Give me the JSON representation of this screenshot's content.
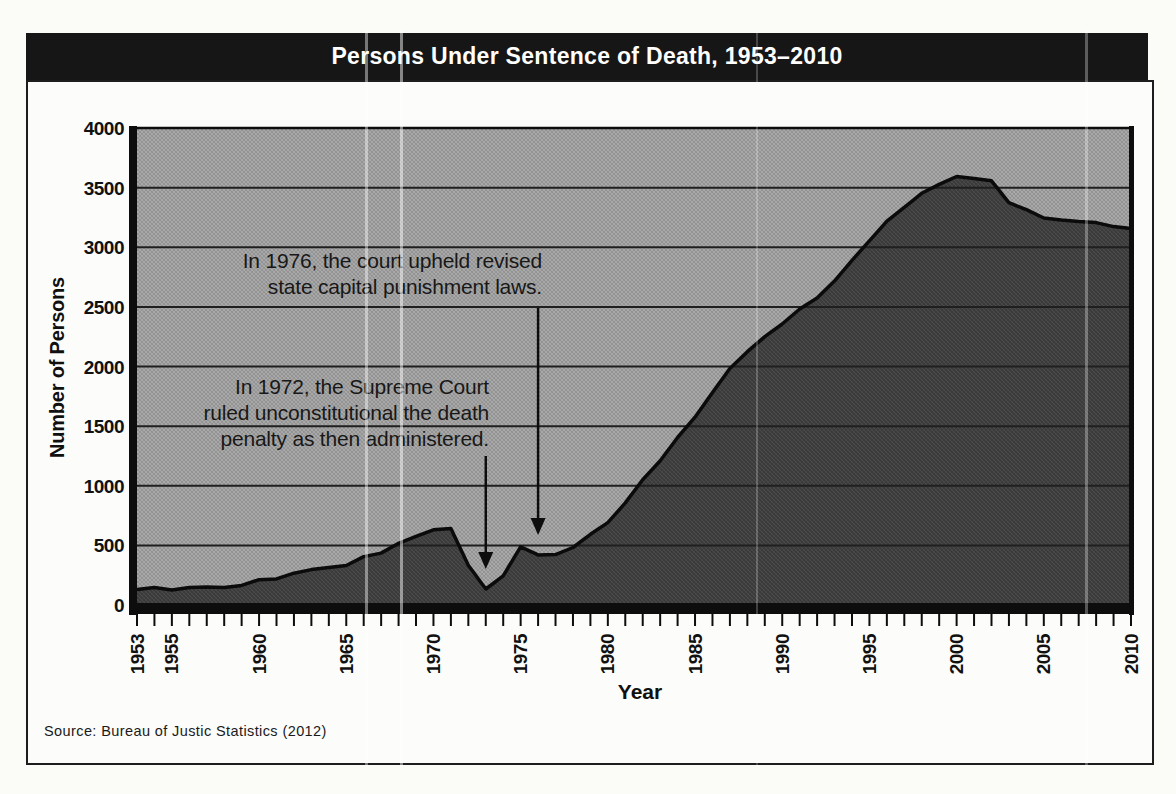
{
  "header": {
    "title": "Persons Under Sentence of Death, 1953–2010",
    "background": "#161616",
    "text_color": "#ffffff"
  },
  "chart_data": {
    "type": "area",
    "title": "Persons Under Sentence of Death, 1953–2010",
    "xlabel": "Year",
    "ylabel": "Number of Persons",
    "ylim": [
      0,
      4000
    ],
    "ytick_step": 500,
    "yticks": [
      0,
      500,
      1000,
      1500,
      2000,
      2500,
      3000,
      3500,
      4000
    ],
    "xtick_labels": [
      1953,
      1955,
      1960,
      1965,
      1970,
      1975,
      1980,
      1985,
      1990,
      1995,
      2000,
      2005,
      2010
    ],
    "grid": "horizontal",
    "legend": "none",
    "x": [
      1953,
      1954,
      1955,
      1956,
      1957,
      1958,
      1959,
      1960,
      1961,
      1962,
      1963,
      1964,
      1965,
      1966,
      1967,
      1968,
      1969,
      1970,
      1971,
      1972,
      1973,
      1974,
      1975,
      1976,
      1977,
      1978,
      1979,
      1980,
      1981,
      1982,
      1983,
      1984,
      1985,
      1986,
      1987,
      1988,
      1989,
      1990,
      1991,
      1992,
      1993,
      1994,
      1995,
      1996,
      1997,
      1998,
      1999,
      2000,
      2001,
      2002,
      2003,
      2004,
      2005,
      2006,
      2007,
      2008,
      2009,
      2010
    ],
    "values": [
      131,
      147,
      125,
      146,
      151,
      147,
      164,
      212,
      219,
      267,
      297,
      315,
      331,
      406,
      435,
      517,
      575,
      631,
      642,
      334,
      134,
      244,
      488,
      420,
      423,
      482,
      593,
      691,
      856,
      1050,
      1209,
      1405,
      1575,
      1781,
      1984,
      2124,
      2250,
      2356,
      2482,
      2575,
      2716,
      2890,
      3054,
      3219,
      3335,
      3452,
      3527,
      3593,
      3577,
      3557,
      3374,
      3315,
      3245,
      3228,
      3215,
      3207,
      3173,
      3158
    ],
    "colors": {
      "plot_bg": "#a6a6a6",
      "area_fill": "#424242",
      "line": "#0b0b0b",
      "grid": "#1f1f1f",
      "axis": "#0d0d0d"
    },
    "annotations": [
      {
        "id": "a1976",
        "text": "In 1976, the court upheld revised\nstate capital punishment laws.",
        "points_to_year": 1976
      },
      {
        "id": "a1972",
        "text": "In 1972, the Supreme Court\nruled unconstitutional the death\npenalty as then administered.",
        "points_to_year": 1973
      }
    ]
  },
  "footer": {
    "source": "Source: Bureau of Justic Statistics (2012)"
  }
}
